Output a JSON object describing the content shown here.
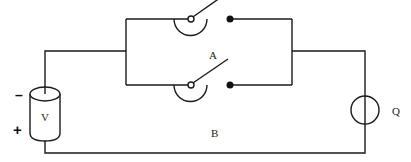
{
  "diagram": {
    "type": "circuit",
    "components": {
      "source": {
        "label": "V",
        "negative_sign": "–",
        "positive_sign": "+"
      },
      "switch_a": {
        "label": "A",
        "state": "open"
      },
      "switch_b": {
        "label": "B",
        "state": "open"
      },
      "load": {
        "label": "Q"
      }
    },
    "colors": {
      "wire": "#1a1a1a",
      "background": "#ffffff"
    }
  }
}
